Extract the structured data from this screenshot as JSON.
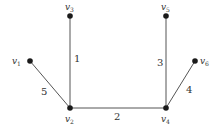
{
  "graph": {
    "nodes": [
      {
        "id": "v1",
        "name": "v",
        "sub": "1",
        "x": 30,
        "y": 61,
        "lx": 12,
        "ly": 64
      },
      {
        "id": "v2",
        "name": "v",
        "sub": "2",
        "x": 70,
        "y": 108,
        "lx": 65,
        "ly": 122
      },
      {
        "id": "v3",
        "name": "v",
        "sub": "3",
        "x": 70,
        "y": 16,
        "lx": 65,
        "ly": 10
      },
      {
        "id": "v4",
        "name": "v",
        "sub": "4",
        "x": 166,
        "y": 108,
        "lx": 161,
        "ly": 122
      },
      {
        "id": "v5",
        "name": "v",
        "sub": "5",
        "x": 166,
        "y": 16,
        "lx": 161,
        "ly": 10
      },
      {
        "id": "v6",
        "name": "v",
        "sub": "6",
        "x": 195,
        "y": 61,
        "lx": 200,
        "ly": 64
      }
    ],
    "edges": [
      {
        "from": "v3",
        "to": "v2",
        "weight": "1",
        "wx": 74,
        "wy": 62
      },
      {
        "from": "v2",
        "to": "v4",
        "weight": "2",
        "wx": 114,
        "wy": 120
      },
      {
        "from": "v5",
        "to": "v4",
        "weight": "3",
        "wx": 157,
        "wy": 66
      },
      {
        "from": "v4",
        "to": "v6",
        "weight": "4",
        "wx": 186,
        "wy": 93
      },
      {
        "from": "v1",
        "to": "v2",
        "weight": "5",
        "wx": 41,
        "wy": 95
      }
    ]
  }
}
